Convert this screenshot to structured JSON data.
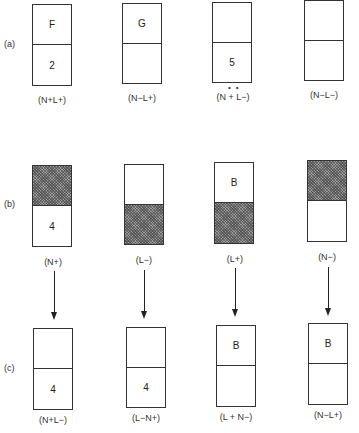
{
  "rows": {
    "a": {
      "label": "(a)",
      "boxes": [
        {
          "top": "F",
          "bottom": "2",
          "caption": "(N+L+)",
          "top_shaded": false,
          "bottom_shaded": false
        },
        {
          "top": "G",
          "bottom": "",
          "caption": "(N−L+)",
          "top_shaded": false,
          "bottom_shaded": false
        },
        {
          "top": "",
          "bottom": "5",
          "caption": "(N + L−)",
          "top_shaded": false,
          "bottom_shaded": false,
          "dots": "••"
        },
        {
          "top": "",
          "bottom": "",
          "caption": "(N−L−)",
          "top_shaded": false,
          "bottom_shaded": false
        }
      ]
    },
    "b": {
      "label": "(b)",
      "boxes": [
        {
          "top": "",
          "bottom": "4",
          "caption": "(N+)",
          "top_shaded": true,
          "bottom_shaded": false
        },
        {
          "top": "",
          "bottom": "",
          "caption": "(L−)",
          "top_shaded": false,
          "bottom_shaded": true
        },
        {
          "top": "B",
          "bottom": "",
          "caption": "(L+)",
          "top_shaded": false,
          "bottom_shaded": true
        },
        {
          "top": "",
          "bottom": "",
          "caption": "(N−)",
          "top_shaded": true,
          "bottom_shaded": false
        }
      ]
    },
    "c": {
      "label": "(c)",
      "boxes": [
        {
          "top": "",
          "bottom": "4",
          "caption": "(N+L−)",
          "top_shaded": false,
          "bottom_shaded": false
        },
        {
          "top": "",
          "bottom": "4",
          "caption": "(L−N+)",
          "top_shaded": false,
          "bottom_shaded": false
        },
        {
          "top": "B",
          "bottom": "",
          "caption": "(L + N−)",
          "top_shaded": false,
          "bottom_shaded": false
        },
        {
          "top": "B",
          "bottom": "",
          "caption": "(N−L+)",
          "top_shaded": false,
          "bottom_shaded": false
        }
      ]
    }
  },
  "arrows": {
    "count": 4,
    "direction": "down",
    "from_row": "b",
    "to_row": "c"
  }
}
